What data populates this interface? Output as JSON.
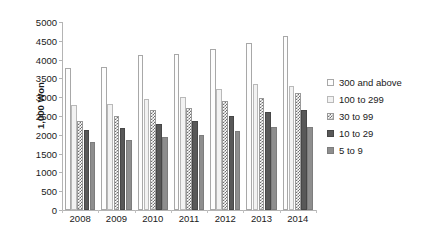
{
  "chart_data": {
    "type": "bar",
    "title": "",
    "subtitle": "",
    "xlabel": "",
    "ylabel": "1,000 Won",
    "ylim": [
      0,
      5000
    ],
    "ytick_step": 500,
    "yticks": [
      "5000",
      "4500",
      "4000",
      "3500",
      "3000",
      "2500",
      "2000",
      "1500",
      "1000",
      "500",
      "0"
    ],
    "grid": false,
    "legend_position": "right",
    "categories": [
      "2008",
      "2009",
      "2010",
      "2011",
      "2012",
      "2013",
      "2014"
    ],
    "series": [
      {
        "name": "300 and above",
        "values": [
          3790,
          3810,
          4120,
          4140,
          4270,
          4430,
          4620
        ],
        "color": "#fdfdfd",
        "pattern": "solid-white-outline"
      },
      {
        "name": "100 to 299",
        "values": [
          2780,
          2820,
          2960,
          3000,
          3230,
          3360,
          3290
        ],
        "color": "#f2f2f2",
        "pattern": "solid-light"
      },
      {
        "name": "30 to 99",
        "values": [
          2380,
          2490,
          2650,
          2720,
          2890,
          2990,
          3110
        ],
        "color": "#6f6f6f",
        "pattern": "checkered"
      },
      {
        "name": "10 to 29",
        "values": [
          2140,
          2180,
          2300,
          2370,
          2500,
          2600,
          2670
        ],
        "color": "#585858",
        "pattern": "solid-dark"
      },
      {
        "name": "5 to 9",
        "values": [
          1820,
          1870,
          1950,
          1990,
          2100,
          2200,
          2210
        ],
        "color": "#8e8e8e",
        "pattern": "solid-medium"
      }
    ]
  }
}
